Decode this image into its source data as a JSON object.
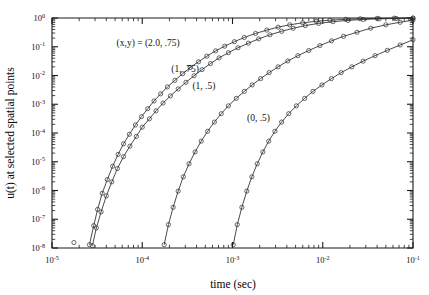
{
  "chart_data": {
    "type": "line",
    "title": "",
    "xlabel": "time (sec)",
    "ylabel": "u(t) at selected spatial points",
    "xscale": "log",
    "yscale": "log",
    "xlim": [
      1e-05,
      0.1
    ],
    "ylim": [
      1e-08,
      1
    ],
    "grid": false,
    "legend_position": "inline-annotations",
    "x_tick_labels": [
      "10-5",
      "10-4",
      "10-3",
      "10-2",
      "10-1"
    ],
    "x_tick_mantissa": "10",
    "x_tick_exponents": [
      "-5",
      "-4",
      "-3",
      "-2",
      "-1"
    ],
    "y_tick_exponents": [
      "0",
      "-1",
      "-2",
      "-3",
      "-4",
      "-5",
      "-6",
      "-7",
      "-8"
    ],
    "marker": "open-circle",
    "series": [
      {
        "name": "(x,y) = (2.0, .75)",
        "annotation": "(x,y) = (2.0, .75)",
        "annotation_x": 5.2e-05,
        "annotation_y": 0.11,
        "x": [
          2.6e-05,
          2.9e-05,
          3.2e-05,
          3.6e-05,
          4.1e-05,
          4.7e-05,
          5.4e-05,
          6.2e-05,
          7.2e-05,
          8.4e-05,
          9.8e-05,
          0.000115,
          0.000135,
          0.00016,
          0.00019,
          0.00023,
          0.00028,
          0.00034,
          0.00042,
          0.00052,
          0.00065,
          0.00082,
          0.00105,
          0.00135,
          0.0018,
          0.0024,
          0.0032,
          0.0043,
          0.006,
          0.0085,
          0.012,
          0.018,
          0.026,
          0.04,
          0.062,
          0.1
        ],
        "y": [
          1.3e-08,
          6e-08,
          2.2e-07,
          8e-07,
          2.4e-06,
          7e-06,
          1.8e-05,
          4.2e-05,
          9e-05,
          0.00019,
          0.00037,
          0.0007,
          0.0013,
          0.0023,
          0.004,
          0.0068,
          0.0115,
          0.019,
          0.03,
          0.047,
          0.072,
          0.105,
          0.15,
          0.21,
          0.29,
          0.38,
          0.48,
          0.58,
          0.68,
          0.77,
          0.84,
          0.9,
          0.94,
          0.97,
          0.985,
          0.995
        ]
      },
      {
        "name": "(1, .75)",
        "annotation": "(1, .75)",
        "annotation_x": 0.00021,
        "annotation_y": 0.013,
        "x": [
          2.8e-05,
          3.1e-05,
          3.5e-05,
          4e-05,
          4.6e-05,
          5.3e-05,
          6.2e-05,
          7.3e-05,
          8.6e-05,
          0.0001,
          0.00012,
          0.000142,
          0.00017,
          0.000205,
          0.00025,
          0.000305,
          0.000375,
          0.00046,
          0.00057,
          0.00071,
          0.0009,
          0.00115,
          0.0015,
          0.00195,
          0.0026,
          0.0035,
          0.0047,
          0.0064,
          0.009,
          0.013,
          0.019,
          0.028,
          0.042,
          0.065,
          0.1
        ],
        "y": [
          1.2e-08,
          5e-08,
          1.8e-07,
          6.5e-07,
          2e-06,
          5.8e-06,
          1.5e-05,
          3.5e-05,
          7.6e-05,
          0.00016,
          0.00031,
          0.00059,
          0.0011,
          0.00195,
          0.0034,
          0.0058,
          0.0098,
          0.016,
          0.026,
          0.041,
          0.062,
          0.092,
          0.133,
          0.188,
          0.26,
          0.345,
          0.44,
          0.545,
          0.65,
          0.745,
          0.825,
          0.89,
          0.935,
          0.965,
          0.99
        ]
      },
      {
        "name": "(1, .5)",
        "annotation": "(1, .5)",
        "annotation_x": 0.00036,
        "annotation_y": 0.0033,
        "x": [
          0.000175,
          0.000195,
          0.00022,
          0.00025,
          0.000285,
          0.00033,
          0.000385,
          0.00045,
          0.00053,
          0.00063,
          0.00075,
          0.0009,
          0.0011,
          0.00135,
          0.00165,
          0.00205,
          0.00255,
          0.0032,
          0.0041,
          0.0053,
          0.007,
          0.0093,
          0.0125,
          0.017,
          0.024,
          0.034,
          0.05,
          0.072,
          0.1
        ],
        "y": [
          1.3e-08,
          6.5e-08,
          2.6e-07,
          9.5e-07,
          3e-06,
          8.5e-06,
          2.2e-05,
          5.2e-05,
          0.000115,
          0.00024,
          0.00047,
          0.00088,
          0.0016,
          0.0028,
          0.0047,
          0.0078,
          0.0126,
          0.02,
          0.032,
          0.049,
          0.074,
          0.11,
          0.16,
          0.23,
          0.32,
          0.44,
          0.58,
          0.71,
          0.85
        ]
      },
      {
        "name": "(0, .5)",
        "annotation": "(0, .5)",
        "annotation_x": 0.00145,
        "annotation_y": 0.00026,
        "x": [
          0.00102,
          0.00113,
          0.00127,
          0.00144,
          0.00164,
          0.00188,
          0.00217,
          0.00252,
          0.00295,
          0.0035,
          0.0042,
          0.0051,
          0.0063,
          0.0078,
          0.0098,
          0.0125,
          0.016,
          0.021,
          0.028,
          0.038,
          0.052,
          0.072,
          0.1
        ],
        "y": [
          1.3e-08,
          6.5e-08,
          2.6e-07,
          9.5e-07,
          3e-06,
          8.5e-06,
          2.2e-05,
          5.2e-05,
          0.000115,
          0.00024,
          0.00047,
          0.00088,
          0.0016,
          0.0028,
          0.0047,
          0.0078,
          0.0126,
          0.02,
          0.0315,
          0.049,
          0.075,
          0.115,
          0.175
        ]
      }
    ],
    "stray_points": [
      {
        "x": 1.75e-05,
        "y": 1.55e-08
      }
    ]
  }
}
